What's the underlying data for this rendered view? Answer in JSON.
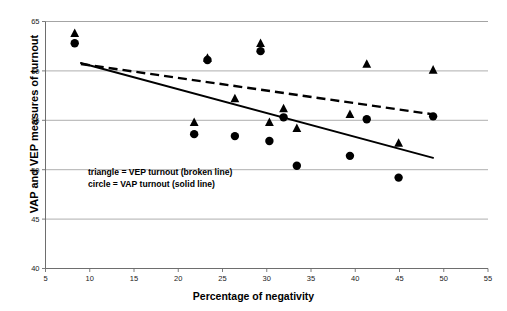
{
  "chart_data": {
    "type": "scatter",
    "title": "",
    "xlabel": "Percentage of negativity",
    "ylabel": "VAP and VEP measures of turnout",
    "xlim": [
      5,
      55
    ],
    "ylim": [
      40,
      65
    ],
    "xticks": [
      5,
      10,
      15,
      20,
      25,
      30,
      35,
      40,
      45,
      50,
      55
    ],
    "yticks": [
      40,
      45,
      50,
      55,
      60,
      65
    ],
    "grid": "horizontal",
    "legend_position": "inside-lower-left",
    "legend_entries": [
      "triangle = VEP turnout (broken line)",
      "circle = VAP turnout (solid line)"
    ],
    "series": [
      {
        "name": "VEP turnout",
        "marker": "triangle",
        "color": "#000000",
        "trendline": "dashed",
        "points": [
          {
            "x": 8.3,
            "y": 63.8
          },
          {
            "x": 23.3,
            "y": 61.3
          },
          {
            "x": 29.3,
            "y": 62.8
          },
          {
            "x": 41.3,
            "y": 60.7
          },
          {
            "x": 48.8,
            "y": 60.1
          },
          {
            "x": 26.4,
            "y": 57.2
          },
          {
            "x": 31.9,
            "y": 56.2
          },
          {
            "x": 39.4,
            "y": 55.6
          },
          {
            "x": 21.8,
            "y": 54.8
          },
          {
            "x": 30.3,
            "y": 54.8
          },
          {
            "x": 33.4,
            "y": 54.2
          },
          {
            "x": 44.9,
            "y": 52.7
          }
        ],
        "trend_start": {
          "x": 9.0,
          "y": 60.7
        },
        "trend_end": {
          "x": 48.8,
          "y": 55.6
        }
      },
      {
        "name": "VAP turnout",
        "marker": "circle",
        "color": "#000000",
        "trendline": "solid",
        "points": [
          {
            "x": 8.3,
            "y": 62.8
          },
          {
            "x": 23.3,
            "y": 61.1
          },
          {
            "x": 29.3,
            "y": 62.0
          },
          {
            "x": 31.9,
            "y": 55.3
          },
          {
            "x": 41.3,
            "y": 55.1
          },
          {
            "x": 48.8,
            "y": 55.4
          },
          {
            "x": 21.8,
            "y": 53.6
          },
          {
            "x": 26.4,
            "y": 53.4
          },
          {
            "x": 30.3,
            "y": 52.9
          },
          {
            "x": 39.4,
            "y": 51.4
          },
          {
            "x": 33.4,
            "y": 50.4
          },
          {
            "x": 44.9,
            "y": 49.2
          }
        ],
        "trend_start": {
          "x": 9.0,
          "y": 60.8
        },
        "trend_end": {
          "x": 48.8,
          "y": 51.2
        }
      }
    ]
  },
  "axes": {
    "x_title": "Percentage of negativity",
    "y_title": "VAP and VEP measures of turnout"
  },
  "legend": {
    "line1": "triangle = VEP turnout (broken line)",
    "line2": "circle = VAP turnout (solid line)"
  },
  "colors": {
    "marker": "#000000",
    "axis": "#6e6e6e",
    "grid": "#9a9a9a",
    "trend": "#000000",
    "background": "#ffffff"
  }
}
